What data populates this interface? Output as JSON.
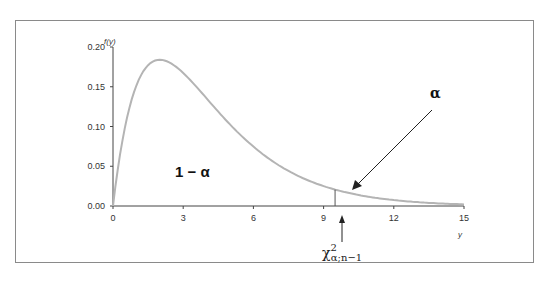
{
  "chart_data": {
    "type": "line",
    "title": "",
    "distribution": "chi-square density, df = 4",
    "xlabel": "y",
    "ylabel": "f(y)",
    "xlim": [
      0,
      15
    ],
    "ylim": [
      0,
      0.2
    ],
    "x_ticks": [
      "0",
      "3",
      "6",
      "9",
      "12",
      "15"
    ],
    "y_ticks": [
      "0.00",
      "0.05",
      "0.10",
      "0.15",
      "0.20"
    ],
    "series": [
      {
        "name": "f(y)",
        "color": "#b4b4b4",
        "x": [
          0,
          0.5,
          1,
          1.5,
          2,
          2.5,
          3,
          4,
          5,
          6,
          7,
          8,
          9,
          10,
          11,
          12,
          13,
          14,
          15
        ],
        "values": [
          0.0,
          0.097,
          0.152,
          0.177,
          0.184,
          0.179,
          0.167,
          0.135,
          0.103,
          0.075,
          0.053,
          0.037,
          0.025,
          0.017,
          0.011,
          0.007,
          0.005,
          0.003,
          0.002
        ]
      }
    ],
    "critical_value": 9.49,
    "annotations": [
      {
        "text": "1 − α",
        "x": 4.3,
        "y": 0.04,
        "note": "area left of critical value"
      },
      {
        "text": "α",
        "x": 13.2,
        "y": 0.11,
        "note": "upper tail area, arrow to tail"
      },
      {
        "text": "χ²α;n−1",
        "x": 9.49,
        "y": -0.045,
        "note": "critical value marker with upward arrow"
      }
    ],
    "grid": false,
    "legend": "none"
  },
  "labels": {
    "y_axis_title": "f(y)",
    "x_axis_title": "y",
    "area_left": "1 − α",
    "area_right": "α",
    "crit_chi": "χ",
    "crit_sup": "2",
    "crit_sub": "α;n−1"
  }
}
